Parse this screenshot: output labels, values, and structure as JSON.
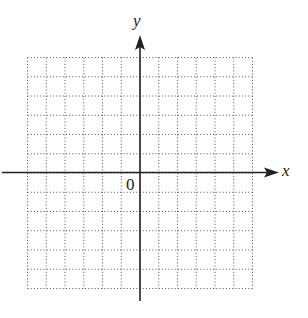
{
  "diagram": {
    "type": "coordinate-grid",
    "axes": {
      "x_label": "x",
      "y_label": "y",
      "origin_label": "0"
    },
    "grid": {
      "cells_x": 12,
      "cells_y": 12,
      "line_style": "dotted",
      "line_color": "#555555"
    },
    "axis_color": "#222222"
  }
}
